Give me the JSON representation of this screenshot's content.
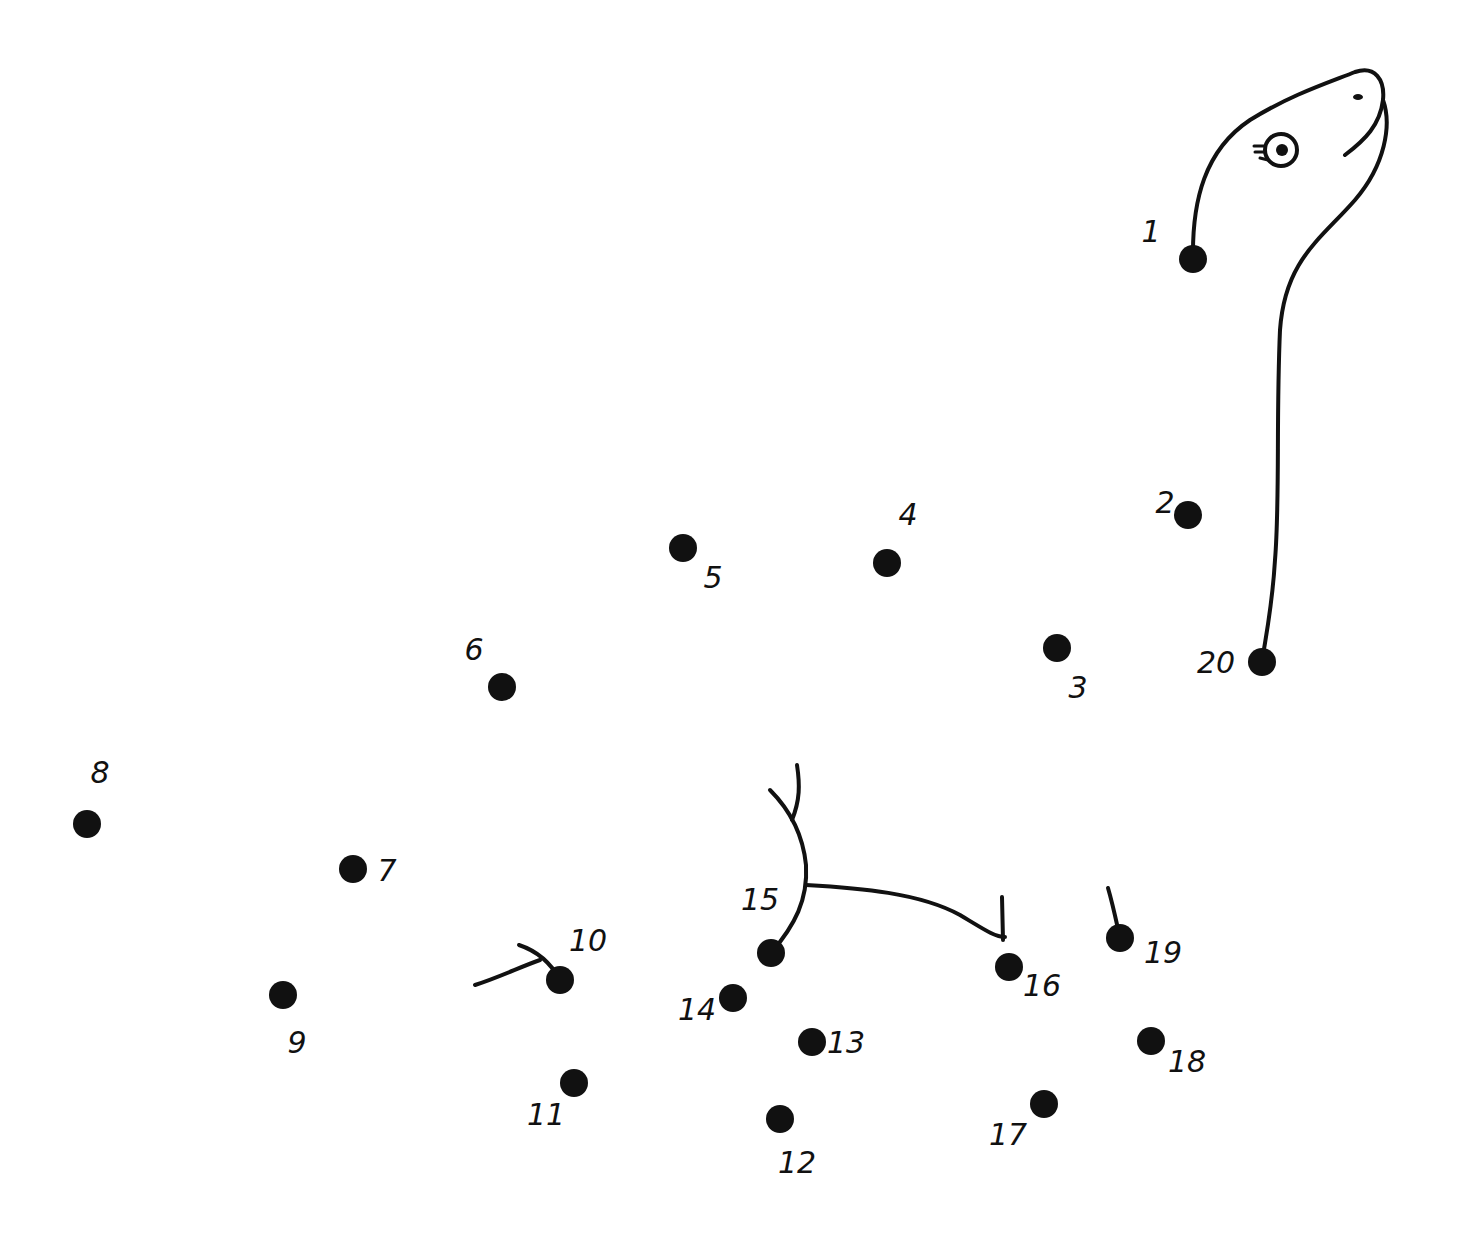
{
  "puzzle": {
    "type": "connect-the-dots",
    "subject": "dinosaur",
    "ink_color": "#111111",
    "background_color": "#ffffff",
    "dots": [
      {
        "n": "1",
        "x": 1193,
        "y": 259,
        "lx": 1151,
        "ly": 232
      },
      {
        "n": "2",
        "x": 1188,
        "y": 515,
        "lx": 1165,
        "ly": 503
      },
      {
        "n": "3",
        "x": 1057,
        "y": 648,
        "lx": 1078,
        "ly": 688
      },
      {
        "n": "4",
        "x": 887,
        "y": 563,
        "lx": 908,
        "ly": 515
      },
      {
        "n": "5",
        "x": 683,
        "y": 548,
        "lx": 713,
        "ly": 578
      },
      {
        "n": "6",
        "x": 502,
        "y": 687,
        "lx": 474,
        "ly": 650
      },
      {
        "n": "7",
        "x": 353,
        "y": 869,
        "lx": 387,
        "ly": 871
      },
      {
        "n": "8",
        "x": 87,
        "y": 824,
        "lx": 100,
        "ly": 773
      },
      {
        "n": "9",
        "x": 283,
        "y": 995,
        "lx": 297,
        "ly": 1043
      },
      {
        "n": "10",
        "x": 560,
        "y": 980,
        "lx": 588,
        "ly": 941
      },
      {
        "n": "11",
        "x": 574,
        "y": 1083,
        "lx": 546,
        "ly": 1115
      },
      {
        "n": "12",
        "x": 780,
        "y": 1119,
        "lx": 797,
        "ly": 1163
      },
      {
        "n": "13",
        "x": 812,
        "y": 1042,
        "lx": 846,
        "ly": 1043
      },
      {
        "n": "14",
        "x": 733,
        "y": 998,
        "lx": 697,
        "ly": 1010
      },
      {
        "n": "15",
        "x": 771,
        "y": 953,
        "lx": 760,
        "ly": 900
      },
      {
        "n": "16",
        "x": 1009,
        "y": 967,
        "lx": 1042,
        "ly": 986
      },
      {
        "n": "17",
        "x": 1044,
        "y": 1104,
        "lx": 1008,
        "ly": 1135
      },
      {
        "n": "18",
        "x": 1151,
        "y": 1041,
        "lx": 1187,
        "ly": 1062
      },
      {
        "n": "19",
        "x": 1120,
        "y": 938,
        "lx": 1163,
        "ly": 953
      },
      {
        "n": "20",
        "x": 1262,
        "y": 662,
        "lx": 1216,
        "ly": 663
      }
    ]
  }
}
